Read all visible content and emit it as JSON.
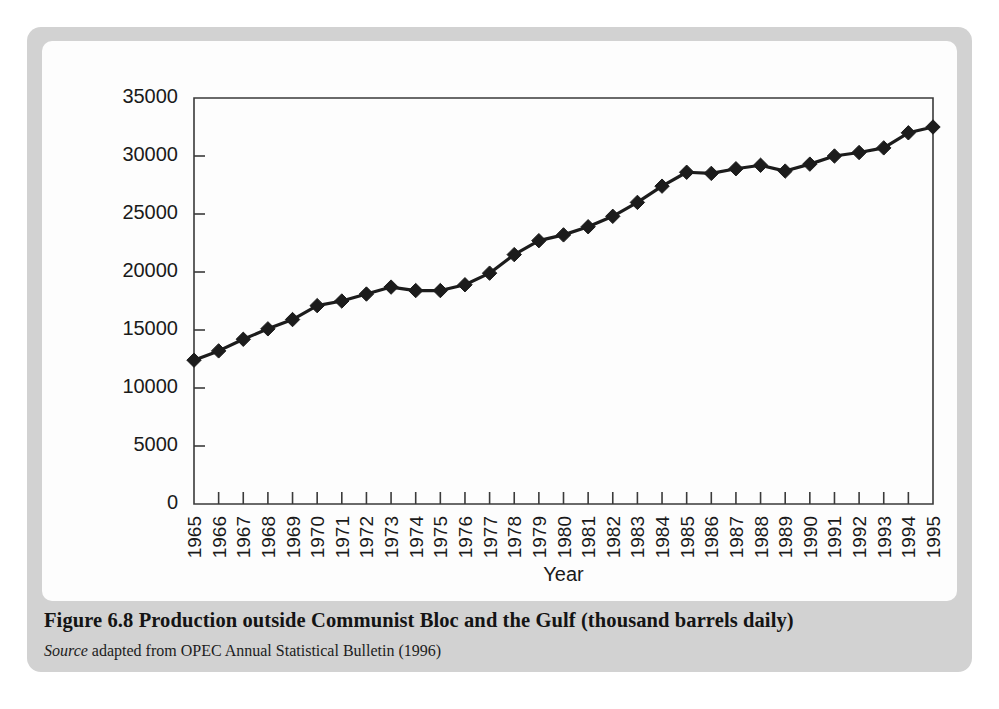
{
  "figure": {
    "caption_label": "Figure 6.8",
    "caption_title": "Production outside Communist Bloc and the Gulf (thousand barrels daily)",
    "caption_full": "Figure 6.8   Production outside Communist Bloc and the Gulf (thousand barrels daily)",
    "source_word": "Source",
    "source_text": " adapted from OPEC Annual Statistical Bulletin (1996)"
  },
  "colors": {
    "frame": "#d2d2d2",
    "card": "#fdfdfd",
    "axis": "#3a3a3a",
    "series": "#1c1c1c",
    "text": "#1a1a1a"
  },
  "chart_data": {
    "type": "line",
    "title": "",
    "xlabel": "Year",
    "ylabel": "",
    "ylim": [
      0,
      35000
    ],
    "ytick_labels": [
      "0",
      "5000",
      "10000",
      "15000",
      "20000",
      "25000",
      "30000",
      "35000"
    ],
    "yticks": [
      0,
      5000,
      10000,
      15000,
      20000,
      25000,
      30000,
      35000
    ],
    "grid": false,
    "legend": false,
    "marker": "diamond",
    "categories": [
      "1965",
      "1966",
      "1967",
      "1968",
      "1969",
      "1970",
      "1971",
      "1972",
      "1973",
      "1974",
      "1975",
      "1976",
      "1977",
      "1978",
      "1979",
      "1980",
      "1981",
      "1982",
      "1983",
      "1984",
      "1985",
      "1986",
      "1987",
      "1988",
      "1989",
      "1990",
      "1991",
      "1992",
      "1993",
      "1994",
      "1995"
    ],
    "values": [
      12400,
      13200,
      14200,
      15100,
      15900,
      17100,
      17500,
      18100,
      18700,
      18400,
      18400,
      18900,
      19900,
      21500,
      22700,
      23200,
      23900,
      24800,
      26000,
      27400,
      28600,
      28500,
      28900,
      29200,
      28700,
      29300,
      30000,
      30300,
      30700,
      32000,
      32500
    ]
  }
}
